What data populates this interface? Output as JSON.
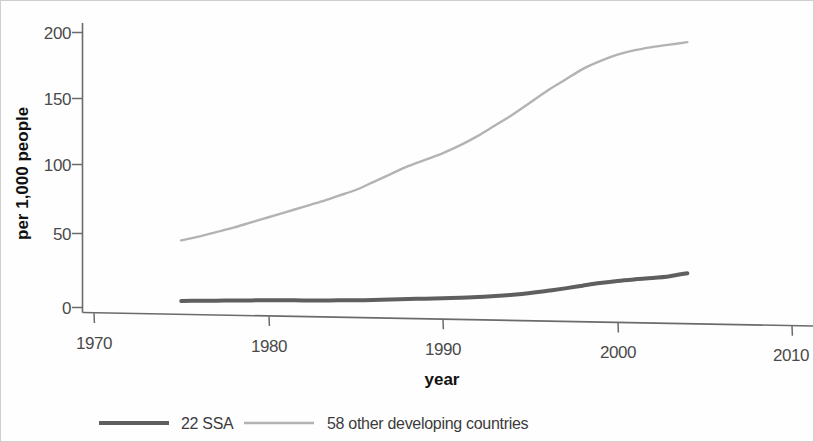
{
  "chart_data": {
    "type": "line",
    "title": "",
    "xlabel": "year",
    "ylabel": "per 1,000 people",
    "xlim": [
      1970,
      2010
    ],
    "ylim": [
      0,
      200
    ],
    "xticks": [
      1970,
      1980,
      1990,
      2000,
      2010
    ],
    "yticks": [
      0,
      50,
      100,
      150,
      200
    ],
    "xtick_labels": [
      "1970",
      "1980",
      "1990",
      "2000",
      "2010"
    ],
    "ytick_labels": [
      "0",
      "50",
      "100",
      "150",
      "200"
    ],
    "grid": false,
    "legend_position": "bottom-left",
    "x": [
      1975,
      1976,
      1977,
      1978,
      1979,
      1980,
      1981,
      1982,
      1983,
      1984,
      1985,
      1986,
      1987,
      1988,
      1989,
      1990,
      1991,
      1992,
      1993,
      1994,
      1995,
      1996,
      1997,
      1998,
      1999,
      2000,
      2001,
      2002,
      2003,
      2004
    ],
    "series": [
      {
        "name": "22 SSA",
        "color": "#5f5f5f",
        "line_width": 4,
        "values": [
          6,
          6.3,
          6.6,
          7,
          7.3,
          7.6,
          7.8,
          8,
          8.2,
          8.5,
          8.8,
          9.2,
          9.8,
          10.4,
          10.9,
          11.4,
          12,
          12.8,
          13.8,
          15,
          16.5,
          18.3,
          20.3,
          22.5,
          24.6,
          26.4,
          27.8,
          29,
          30.6,
          33
        ]
      },
      {
        "name": "58 other developing countries",
        "color": "#b3b3b3",
        "line_width": 2.4,
        "values": [
          50,
          53,
          56.5,
          60,
          64,
          68,
          72,
          76,
          80,
          84.5,
          89,
          95,
          101,
          107,
          112,
          117,
          123,
          130,
          138,
          146,
          155,
          164,
          172,
          180,
          186,
          191,
          194.5,
          197,
          199,
          201
        ]
      }
    ],
    "annotations": []
  },
  "legend": {
    "items": [
      {
        "label": "22 SSA",
        "color": "#5f5f5f",
        "line_width": 4
      },
      {
        "label": "58 other developing countries",
        "color": "#b3b3b3",
        "line_width": 2.6
      }
    ]
  },
  "axes": {
    "y_title": "per 1,000 people",
    "x_title": "year",
    "y_tick_labels": [
      "200",
      "150",
      "100",
      "50",
      "0"
    ],
    "x_tick_labels": [
      "1970",
      "1980",
      "1990",
      "2000",
      "2010"
    ]
  },
  "colors": {
    "axis": "#6b6b6b",
    "tick_text": "#4a4a4a",
    "title_text": "#111111",
    "series_dark": "#5f5f5f",
    "series_light": "#b3b3b3",
    "background": "#fefefe"
  }
}
